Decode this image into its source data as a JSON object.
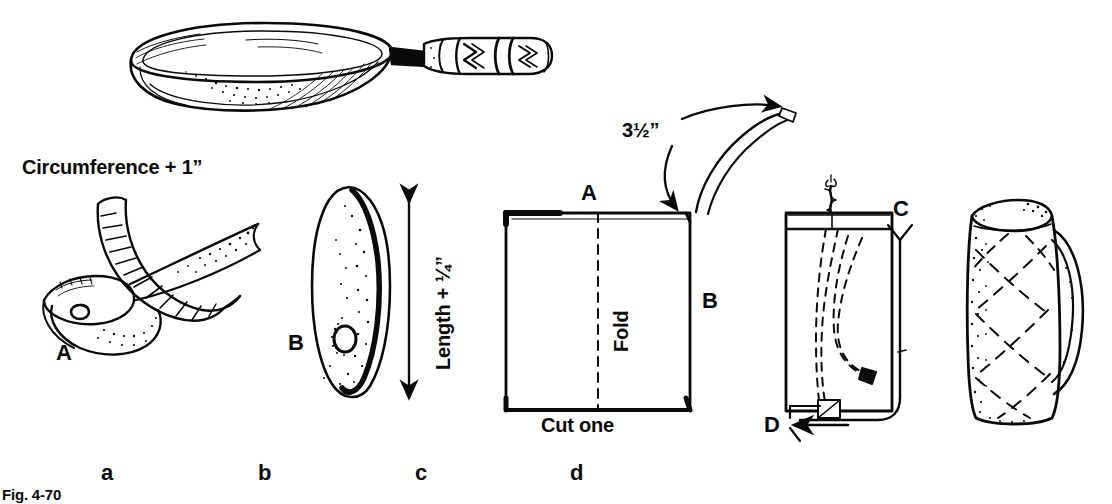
{
  "figure": {
    "caption": "Fig. 4-70",
    "title_alt": "Making a quilted skillet handle cover",
    "ink_color": "#0a0a0a",
    "background_color": "#ffffff"
  },
  "annotations": {
    "circumference": "Circumference  + 1”",
    "length": "Length + ¼”",
    "handle_length": "3½”",
    "fold": "Fold",
    "cut_one": "Cut one",
    "point_a_panel_a": "A",
    "point_b_panel_b": "B",
    "point_a_panel_c": "A",
    "point_b_panel_c": "B",
    "point_c_panel_d": "C",
    "point_d_panel_d": "D"
  },
  "panels": [
    {
      "key": "a",
      "letter": "a",
      "name": "measure-handle-circumference"
    },
    {
      "key": "b",
      "letter": "b",
      "name": "pattern-teardrop-shape"
    },
    {
      "key": "c",
      "letter": "c",
      "name": "fabric-square-fold-cut-one"
    },
    {
      "key": "d",
      "letter": "d",
      "name": "stitch-and-turn-cover"
    },
    {
      "key": "e",
      "letter": "",
      "name": "finished-quilted-cover"
    }
  ],
  "icons": {
    "skillet": "frying-pan-icon",
    "tape_measure": "tape-measure-icon",
    "arrow_down": "arrow-down-icon",
    "arrow_left": "arrow-left-icon",
    "arrow_up_curve": "curved-arrow-icon",
    "double_arrow_vertical": "double-headed-arrow-icon",
    "thread": "thread-cord-icon"
  }
}
